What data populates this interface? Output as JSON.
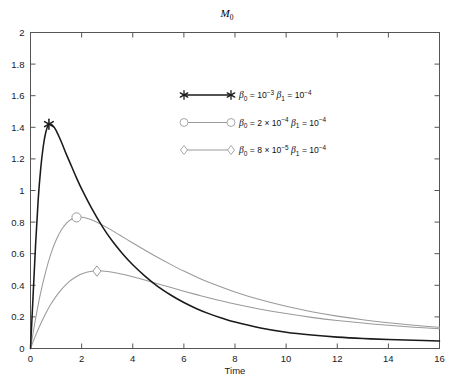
{
  "chart_data": {
    "type": "line",
    "title": "M0",
    "title_base": "M",
    "title_sub": "0",
    "xlabel": "Time",
    "ylabel": "",
    "xlim": [
      0,
      16
    ],
    "ylim": [
      0,
      2
    ],
    "xticks": [
      "0",
      "2",
      "4",
      "6",
      "8",
      "10",
      "12",
      "14",
      "16"
    ],
    "xtick_values": [
      0,
      2,
      4,
      6,
      8,
      10,
      12,
      14,
      16
    ],
    "yticks": [
      "0",
      "0.2",
      "0.4",
      "0.6",
      "0.8",
      "1",
      "1.2",
      "1.4",
      "1.6",
      "1.8",
      "2"
    ],
    "ytick_values": [
      0,
      0.2,
      0.4,
      0.6,
      0.8,
      1,
      1.2,
      1.4,
      1.6,
      1.8,
      2
    ],
    "grid": false,
    "legend_position": "upper-center",
    "colors": {
      "series_1": "#1a1a1a",
      "series_2": "#9a9a9a",
      "series_3": "#9a9a9a",
      "axis": "#4d4d4d",
      "background": "#ffffff"
    },
    "series": [
      {
        "name": "beta0 = 10^-3, beta1 = 10^-4",
        "marker": "asterisk",
        "color": "#1a1a1a",
        "beta0_label": "10",
        "beta0_exp": "-3",
        "beta1_label": "10",
        "beta1_exp": "-4",
        "beta0_prefix": "",
        "peak_x": 0.72,
        "peak_y": 1.42,
        "x": [
          0,
          0.1,
          0.2,
          0.3,
          0.4,
          0.5,
          0.6,
          0.7,
          0.8,
          0.9,
          1.0,
          1.2,
          1.4,
          1.6,
          1.8,
          2.0,
          2.4,
          2.8,
          3.2,
          3.6,
          4.0,
          4.5,
          5.0,
          5.5,
          6.0,
          6.5,
          7.0,
          7.5,
          8.0,
          9.0,
          10.0,
          11.0,
          12.0,
          13.0,
          14.0,
          15.0,
          16.0
        ],
        "values": [
          0,
          0.33,
          0.66,
          0.94,
          1.14,
          1.28,
          1.37,
          1.415,
          1.42,
          1.405,
          1.38,
          1.31,
          1.23,
          1.155,
          1.08,
          1.01,
          0.885,
          0.775,
          0.68,
          0.6,
          0.53,
          0.455,
          0.39,
          0.337,
          0.291,
          0.252,
          0.219,
          0.191,
          0.167,
          0.13,
          0.103,
          0.085,
          0.072,
          0.063,
          0.057,
          0.052,
          0.048
        ]
      },
      {
        "name": "beta0 = 2 x 10^-4, beta1 = 10^-4",
        "marker": "circle",
        "color": "#9a9a9a",
        "beta0_prefix": "2 × ",
        "beta0_label": "10",
        "beta0_exp": "-4",
        "beta1_label": "10",
        "beta1_exp": "-4",
        "peak_x": 1.8,
        "peak_y": 0.83,
        "x": [
          0,
          0.2,
          0.4,
          0.6,
          0.8,
          1.0,
          1.2,
          1.4,
          1.6,
          1.8,
          2.0,
          2.2,
          2.5,
          3.0,
          3.5,
          4.0,
          4.5,
          5.0,
          5.5,
          6.0,
          6.5,
          7.0,
          8.0,
          9.0,
          10.0,
          11.0,
          12.0,
          13.0,
          14.0,
          15.0,
          16.0
        ],
        "values": [
          0,
          0.19,
          0.355,
          0.49,
          0.6,
          0.685,
          0.748,
          0.792,
          0.818,
          0.83,
          0.831,
          0.825,
          0.807,
          0.765,
          0.717,
          0.668,
          0.62,
          0.574,
          0.531,
          0.49,
          0.452,
          0.418,
          0.358,
          0.308,
          0.267,
          0.233,
          0.205,
          0.182,
          0.163,
          0.147,
          0.134
        ]
      },
      {
        "name": "beta0 = 8 x 10^-5, beta1 = 10^-4",
        "marker": "diamond",
        "color": "#9a9a9a",
        "beta0_prefix": "8 × ",
        "beta0_label": "10",
        "beta0_exp": "-5",
        "beta1_label": "10",
        "beta1_exp": "-4",
        "peak_x": 2.6,
        "peak_y": 0.49,
        "x": [
          0,
          0.2,
          0.4,
          0.6,
          0.8,
          1.0,
          1.2,
          1.5,
          1.8,
          2.1,
          2.4,
          2.6,
          2.8,
          3.2,
          3.6,
          4.0,
          4.5,
          5.0,
          5.5,
          6.0,
          6.5,
          7.0,
          8.0,
          9.0,
          10.0,
          11.0,
          12.0,
          13.0,
          14.0,
          15.0,
          16.0
        ],
        "values": [
          0,
          0.083,
          0.157,
          0.223,
          0.281,
          0.33,
          0.371,
          0.421,
          0.456,
          0.478,
          0.489,
          0.491,
          0.49,
          0.483,
          0.47,
          0.454,
          0.432,
          0.409,
          0.386,
          0.363,
          0.341,
          0.32,
          0.282,
          0.249,
          0.221,
          0.197,
          0.177,
          0.161,
          0.147,
          0.135,
          0.125
        ]
      }
    ],
    "legend_entries": [
      {
        "marker": "asterisk",
        "color": "#1a1a1a",
        "beta0_sym": "β",
        "beta0_sub": "0",
        "beta0_eq": " = ",
        "beta0_prefix": "",
        "beta0_mant": "10",
        "beta0_exp": "−3",
        "beta1_sym": "β",
        "beta1_sub": "1",
        "beta1_eq": " = ",
        "beta1_mant": "10",
        "beta1_exp": "−4"
      },
      {
        "marker": "circle",
        "color": "#9a9a9a",
        "beta0_sym": "β",
        "beta0_sub": "0",
        "beta0_eq": " = ",
        "beta0_prefix": "2 × ",
        "beta0_mant": "10",
        "beta0_exp": "−4",
        "beta1_sym": "β",
        "beta1_sub": "1",
        "beta1_eq": " = ",
        "beta1_mant": "10",
        "beta1_exp": "−4"
      },
      {
        "marker": "diamond",
        "color": "#9a9a9a",
        "beta0_sym": "β",
        "beta0_sub": "0",
        "beta0_eq": " = ",
        "beta0_prefix": "8 × ",
        "beta0_mant": "10",
        "beta0_exp": "−5",
        "beta1_sym": "β",
        "beta1_sub": "1",
        "beta1_eq": " = ",
        "beta1_mant": "10",
        "beta1_exp": "−4"
      }
    ]
  }
}
